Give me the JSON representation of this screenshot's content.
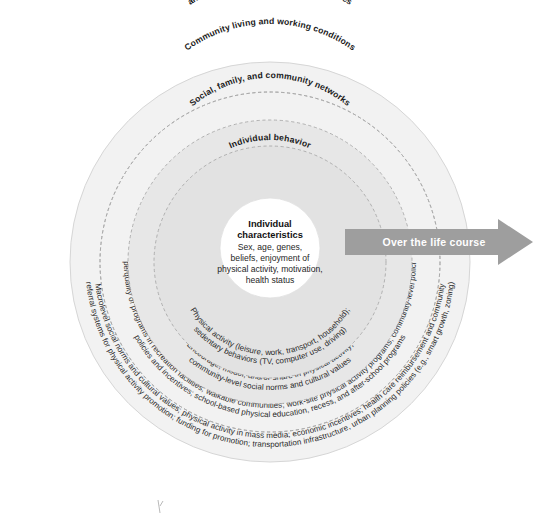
{
  "figure": {
    "colors": {
      "ring_1_outer": "#f2f2f2",
      "ring_2": "#ededed",
      "ring_3": "#e7e7e7",
      "ring_4": "#e2e2e2",
      "ring_5_inner": "#dcdcdc",
      "center_fill": "#ffffff",
      "arrow_fill": "#9e9e9e",
      "dashed_stroke": "#a9a9a9",
      "text": "#1b1b1b",
      "arrow_text": "#ffffff",
      "background": "#ffffff"
    }
  },
  "rings": [
    {
      "id": "macrolevel",
      "title": "Macrolevel social, economic, cultural, health,",
      "title_line2": "and environmental conditions and policies",
      "detail_line1": "Macrolevel social norms and cultural values; physical activity in mass media; economic incentives; health care reimbursement and community",
      "detail_line2": "referral systems for physical activity promotion; funding for promotion; transportation infrastructure, urban planning policies (e.g., smart growth, zoning)"
    },
    {
      "id": "community",
      "title": "Community living and working conditions",
      "detail_line1": "Access to and type/quality of programs in recreation facilities; walkable communities; work-site physical activity programs; community-level policies and programs",
      "detail_line2": "policies and incentives; school-based physical education, recess, and after-school programs"
    },
    {
      "id": "social-networks",
      "title": "Social, family, and community networks",
      "detail_line1": "Encourage, model, and/or share in physical activity;",
      "detail_line2": "community-level social norms and cultural values"
    },
    {
      "id": "individual-behavior",
      "title": "Individual behavior",
      "detail_line1": "Physical activity (leisure, work, transport, household);",
      "detail_line2": "sedentary behaviors (TV, computer use, driving)"
    }
  ],
  "center": {
    "title_line1": "Individual",
    "title_line2": "characteristics",
    "body_line1": "Sex, age, genes,",
    "body_line2": "beliefs, enjoyment of",
    "body_line3": "physical activity, motivation,",
    "body_line4": "health status"
  },
  "arrow": {
    "label": "Over the life course",
    "icon": "arrow-right-icon"
  }
}
